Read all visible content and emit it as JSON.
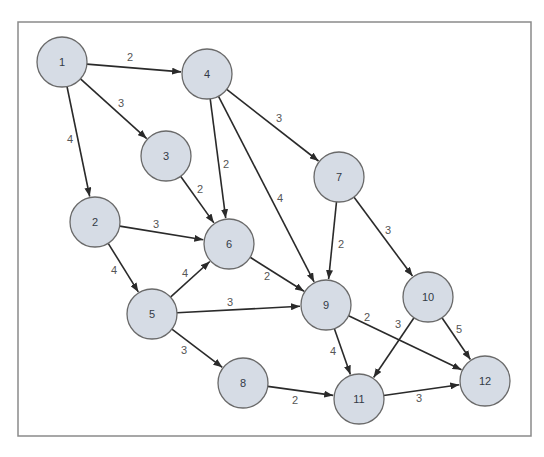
{
  "diagram": {
    "type": "weighted-directed-graph",
    "frame": {
      "x": 18,
      "y": 22,
      "width": 513,
      "height": 414
    },
    "node_radius": 25,
    "colors": {
      "node_fill": "#d6dce5",
      "node_stroke": "#6a6a6a",
      "edge": "#2a2a2a",
      "label": "#333a45",
      "weight_label": "#555555",
      "frame": "#8a8a8a"
    },
    "nodes": [
      {
        "id": "1",
        "label": "1",
        "x": 62,
        "y": 62
      },
      {
        "id": "2",
        "label": "2",
        "x": 95,
        "y": 222
      },
      {
        "id": "3",
        "label": "3",
        "x": 166,
        "y": 156
      },
      {
        "id": "4",
        "label": "4",
        "x": 207,
        "y": 74
      },
      {
        "id": "5",
        "label": "5",
        "x": 152,
        "y": 314
      },
      {
        "id": "6",
        "label": "6",
        "x": 229,
        "y": 244
      },
      {
        "id": "7",
        "label": "7",
        "x": 339,
        "y": 177
      },
      {
        "id": "8",
        "label": "8",
        "x": 243,
        "y": 383
      },
      {
        "id": "9",
        "label": "9",
        "x": 326,
        "y": 305
      },
      {
        "id": "10",
        "label": "10",
        "x": 428,
        "y": 297
      },
      {
        "id": "11",
        "label": "11",
        "x": 359,
        "y": 399
      },
      {
        "id": "12",
        "label": "12",
        "x": 485,
        "y": 381
      }
    ],
    "edges": [
      {
        "from": "1",
        "to": "4",
        "weight": "2",
        "lx": 130,
        "ly": 57
      },
      {
        "from": "1",
        "to": "3",
        "weight": "3",
        "lx": 121,
        "ly": 103
      },
      {
        "from": "1",
        "to": "2",
        "weight": "4",
        "lx": 70,
        "ly": 139
      },
      {
        "from": "4",
        "to": "7",
        "weight": "3",
        "lx": 279,
        "ly": 118
      },
      {
        "from": "4",
        "to": "6",
        "weight": "2",
        "lx": 226,
        "ly": 164
      },
      {
        "from": "4",
        "to": "9",
        "weight": "4",
        "lx": 280,
        "ly": 198
      },
      {
        "from": "3",
        "to": "6",
        "weight": "2",
        "lx": 200,
        "ly": 189
      },
      {
        "from": "2",
        "to": "6",
        "weight": "3",
        "lx": 156,
        "ly": 224
      },
      {
        "from": "2",
        "to": "5",
        "weight": "4",
        "lx": 114,
        "ly": 270
      },
      {
        "from": "5",
        "to": "6",
        "weight": "4",
        "lx": 185,
        "ly": 273
      },
      {
        "from": "5",
        "to": "9",
        "weight": "3",
        "lx": 230,
        "ly": 302
      },
      {
        "from": "5",
        "to": "8",
        "weight": "3",
        "lx": 184,
        "ly": 350
      },
      {
        "from": "6",
        "to": "9",
        "weight": "2",
        "lx": 267,
        "ly": 276
      },
      {
        "from": "7",
        "to": "9",
        "weight": "2",
        "lx": 341,
        "ly": 244
      },
      {
        "from": "7",
        "to": "10",
        "weight": "3",
        "lx": 388,
        "ly": 230
      },
      {
        "from": "9",
        "to": "11",
        "weight": "4",
        "lx": 333,
        "ly": 351
      },
      {
        "from": "9",
        "to": "12",
        "weight": "2",
        "lx": 367,
        "ly": 317
      },
      {
        "from": "10",
        "to": "11",
        "weight": "3",
        "lx": 398,
        "ly": 324
      },
      {
        "from": "10",
        "to": "12",
        "weight": "5",
        "lx": 459,
        "ly": 329
      },
      {
        "from": "8",
        "to": "11",
        "weight": "2",
        "lx": 295,
        "ly": 400
      },
      {
        "from": "11",
        "to": "12",
        "weight": "3",
        "lx": 419,
        "ly": 398
      }
    ]
  }
}
